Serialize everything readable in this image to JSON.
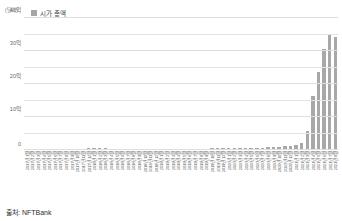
{
  "unit_label": "(달러)",
  "legend": {
    "swatch_color": "#a6a6a6",
    "label": "시가 총액"
  },
  "source": "출처: NFTBank",
  "chart_data": {
    "type": "bar",
    "title": "",
    "subtitle": "",
    "xlabel": "",
    "ylabel": "(달러)",
    "ylim": [
      0,
      40
    ],
    "yticks": [
      0,
      10,
      20,
      30,
      40
    ],
    "ytick_labels": [
      "0",
      "10억",
      "20억",
      "30억",
      "40억"
    ],
    "minor_gridline_step": 5,
    "grid": true,
    "legend_position": "top-left",
    "bar_color": "#a8a8a8",
    "value_unit": "억 달러",
    "series_name": "시가 총액",
    "categories": [
      "2017년 1월",
      "2017년 2월",
      "2017년 3월",
      "2017년 4월",
      "2017년 5월",
      "2017년 6월",
      "2017년 7월",
      "2017년 8월",
      "2017년 9월",
      "2017년 10월",
      "2017년 11월",
      "2017년 12월",
      "2018년 1월",
      "2018년 2월",
      "2018년 3월",
      "2018년 4월",
      "2018년 5월",
      "2018년 6월",
      "2018년 7월",
      "2018년 8월",
      "2018년 9월",
      "2018년 10월",
      "2018년 11월",
      "2018년 12월",
      "2019년 1월",
      "2019년 2월",
      "2019년 3월",
      "2019년 4월",
      "2019년 5월",
      "2019년 6월",
      "2019년 7월",
      "2019년 8월",
      "2019년 9월",
      "2019년 10월",
      "2019년 11월",
      "2019년 12월",
      "2020년 1월",
      "2020년 2월",
      "2020년 3월",
      "2020년 4월",
      "2020년 5월",
      "2020년 6월",
      "2020년 7월",
      "2020년 8월",
      "2020년 9월",
      "2020년 10월",
      "2020년 11월",
      "2020년 12월",
      "2021년 1월",
      "2021년 2월",
      "2021년 3월",
      "2021년 4월",
      "2021년 5월",
      "2021년 6월",
      "2021년 7월",
      "2021년 8월"
    ],
    "values": [
      0.02,
      0.02,
      0.03,
      0.03,
      0.04,
      0.04,
      0.05,
      0.06,
      0.07,
      0.08,
      0.1,
      0.22,
      0.2,
      0.18,
      0.16,
      0.15,
      0.15,
      0.14,
      0.13,
      0.12,
      0.12,
      0.11,
      0.11,
      0.1,
      0.1,
      0.11,
      0.12,
      0.12,
      0.13,
      0.14,
      0.14,
      0.15,
      0.15,
      0.16,
      0.17,
      0.18,
      0.19,
      0.2,
      0.18,
      0.22,
      0.26,
      0.32,
      0.45,
      0.7,
      0.6,
      0.75,
      0.95,
      1.05,
      1.35,
      1.9,
      5.6,
      16.2,
      23.4,
      30.4,
      34.8,
      34.1
    ]
  }
}
